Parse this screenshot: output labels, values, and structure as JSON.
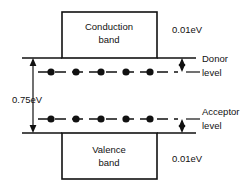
{
  "figure": {
    "bands": {
      "conduction": {
        "label_line1": "Conduction",
        "label_line2": "band"
      },
      "valence": {
        "label_line1": "Valence",
        "label_line2": "band"
      }
    },
    "levels": {
      "donor": {
        "label_line1": "Donor",
        "label_line2": "level",
        "dot_count": 5
      },
      "acceptor": {
        "label_line1": "Acceptor",
        "label_line2": "level",
        "dot_count": 5
      }
    },
    "annotations": {
      "band_gap": "0.75eV",
      "donor_offset": "0.01eV",
      "acceptor_offset": "0.01eV"
    },
    "colors": {
      "ink": "#111111",
      "paper": "#ffffff"
    }
  }
}
